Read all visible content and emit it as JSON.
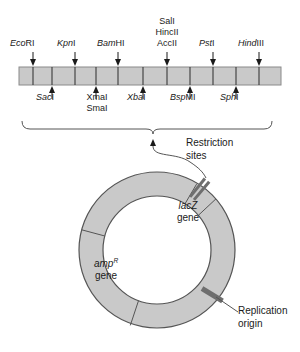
{
  "figure": {
    "colors": {
      "bar_fill": "#c9c9c9",
      "bar_stroke": "#3a3a3a",
      "ring_fill": "#c9c9c9",
      "ring_stroke": "#555555",
      "site_dark": "#6e6e6e",
      "text": "#1a1a1a",
      "line": "#555555"
    }
  },
  "polylinker": {
    "top_sites": [
      {
        "id": "ecori",
        "italic": "Eco",
        "roman": "RI",
        "x": 33
      },
      {
        "id": "kpni",
        "italic": "Kpn",
        "roman": "I",
        "x": 75
      },
      {
        "id": "bamhi",
        "italic": "Bam",
        "roman": "HI",
        "x": 118
      },
      {
        "id": "salI-hincII-accII",
        "italic": "Sal",
        "roman": "I",
        "x": 167
      },
      {
        "id": "psti",
        "italic": "Pst",
        "roman": "I",
        "x": 213
      },
      {
        "id": "hindiii",
        "italic": "Hind",
        "roman": "III",
        "x": 259
      }
    ],
    "stacked_label": {
      "line1_italic": "Sal",
      "line1_roman": "I",
      "line2_italic": "Hinc",
      "line2_roman": "II",
      "line3_italic": "Acc",
      "line3_roman": "II"
    },
    "bottom_sites": [
      {
        "id": "saci",
        "italic": "Sac",
        "roman": "I",
        "x": 52
      },
      {
        "id": "xmai-smai",
        "italic": "Xma",
        "roman": "I",
        "x": 96,
        "italic2": "Sma",
        "roman2": "I"
      },
      {
        "id": "xbai",
        "italic": "Xba",
        "roman": "I",
        "x": 143
      },
      {
        "id": "bspmi",
        "italic": "Bsp",
        "roman": "MI",
        "x": 190
      },
      {
        "id": "sphi",
        "italic": "Sph",
        "roman": "I",
        "x": 236
      }
    ],
    "bracket_label_line1": "Restriction",
    "bracket_label_line2": "sites"
  },
  "plasmid": {
    "lacz_gene_line1": "lacZ",
    "lacz_gene_line2": "gene",
    "amp_gene_line1": "amp",
    "amp_gene_superscript": "R",
    "amp_gene_line2": "gene",
    "replication_origin_line1": "Replication",
    "replication_origin_line2": "origin"
  }
}
